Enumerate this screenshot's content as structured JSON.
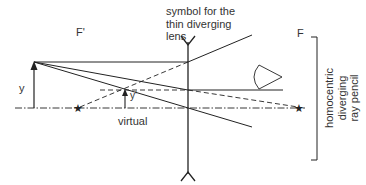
{
  "diagram": {
    "labels": {
      "lens_symbol": "symbol for the\nthin diverging\nlens",
      "focal_object_side": "F'",
      "focal_image_side": "F",
      "object_height": "y",
      "image_height": "y'",
      "image_type": "virtual",
      "ray_pencil": "homocentric diverging\nray pencil"
    },
    "colors": {
      "line": "#222222",
      "text": "#333333",
      "background": "#ffffff"
    },
    "elements": {
      "optical_axis": {
        "style": "dash-dot",
        "y": 108,
        "x_start": 15,
        "x_end": 305
      },
      "lens": {
        "type": "thin diverging",
        "x": 188,
        "y_top": 40,
        "y_bottom": 175
      },
      "object_arrow": {
        "x": 34,
        "y_base": 108,
        "y_tip": 62
      },
      "image_arrow": {
        "x": 125,
        "y_base": 108,
        "y_tip": 90
      },
      "focal_point_object_side": {
        "x": 78,
        "y": 108,
        "marker": "star"
      },
      "focal_point_image_side": {
        "x": 300,
        "y": 108,
        "marker": "star"
      },
      "eye": {
        "x": 270,
        "y": 77
      },
      "bracket": {
        "x": 318,
        "y_top": 37,
        "y_bottom": 160
      }
    }
  }
}
